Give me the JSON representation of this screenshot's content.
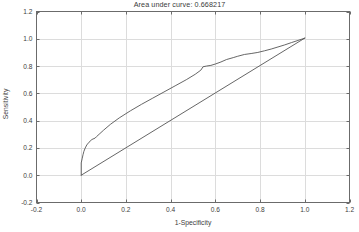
{
  "chart_data": {
    "type": "line",
    "title": "Area under curve: 0.668217",
    "xlabel": "1-Specificity",
    "ylabel": "Sensitivity",
    "xlim": [
      -0.2,
      1.2
    ],
    "ylim": [
      -0.2,
      1.2
    ],
    "xticks": [
      "-0.2",
      "0.0",
      "0.2",
      "0.4",
      "0.6",
      "0.8",
      "1.0",
      "1.2"
    ],
    "xtick_values": [
      -0.2,
      0.0,
      0.2,
      0.4,
      0.6,
      0.8,
      1.0,
      1.2
    ],
    "yticks": [
      "-0.2",
      "0.0",
      "0.2",
      "0.4",
      "0.6",
      "0.8",
      "1.0",
      "1.2"
    ],
    "ytick_values": [
      -0.2,
      0.0,
      0.2,
      0.4,
      0.6,
      0.8,
      1.0,
      1.2
    ],
    "grid": true,
    "legend": "none",
    "auc": 0.668217,
    "line_color": "#555555",
    "grid_color": "#dcdcdc",
    "axis_color": "#6b6b6b",
    "series": [
      {
        "name": "ROC curve",
        "x": [
          0.0,
          0.0,
          0.004,
          0.008,
          0.012,
          0.018,
          0.025,
          0.035,
          0.048,
          0.062,
          0.068,
          0.08,
          0.1,
          0.13,
          0.17,
          0.22,
          0.27,
          0.32,
          0.37,
          0.42,
          0.47,
          0.51,
          0.535,
          0.545,
          0.56,
          0.58,
          0.6,
          0.625,
          0.65,
          0.68,
          0.7,
          0.73,
          0.76,
          0.79,
          0.82,
          0.85,
          0.88,
          0.91,
          0.94,
          0.97,
          1.0
        ],
        "y": [
          0.0,
          0.09,
          0.12,
          0.15,
          0.175,
          0.2,
          0.222,
          0.242,
          0.262,
          0.272,
          0.282,
          0.3,
          0.33,
          0.372,
          0.42,
          0.472,
          0.52,
          0.565,
          0.61,
          0.655,
          0.7,
          0.74,
          0.77,
          0.795,
          0.8,
          0.805,
          0.815,
          0.83,
          0.848,
          0.862,
          0.872,
          0.885,
          0.892,
          0.9,
          0.912,
          0.925,
          0.94,
          0.955,
          0.972,
          0.988,
          1.005
        ]
      },
      {
        "name": "Reference diagonal",
        "x": [
          0.0,
          1.0
        ],
        "y": [
          0.0,
          1.005
        ]
      }
    ]
  }
}
